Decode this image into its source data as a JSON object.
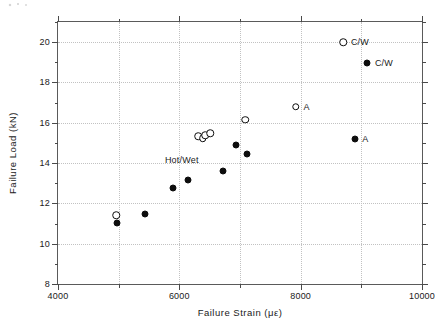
{
  "figure": {
    "background_color": "#ffffff",
    "frame_color": "#5a5a5a",
    "grid_color": "#c2c2c2",
    "marker_color": "#0d0d0d"
  },
  "chart_data": {
    "type": "scatter",
    "title": "",
    "xlabel": "Failure Strain (με)",
    "ylabel": "Failure Load (kN)",
    "xlim": [
      4000,
      10000
    ],
    "ylim": [
      8,
      21
    ],
    "xticks": [
      4000,
      6000,
      8000,
      10000
    ],
    "xtick_labels": [
      "4000",
      "6000",
      "8000",
      "10000"
    ],
    "xticks_minor": [
      5000,
      7000,
      9000
    ],
    "yticks": [
      8,
      10,
      12,
      14,
      16,
      18,
      20
    ],
    "ytick_labels": [
      "8",
      "10",
      "12",
      "14",
      "16",
      "18",
      "20"
    ],
    "yticks_minor": [
      9,
      11,
      13,
      15,
      17,
      19,
      21
    ],
    "grid": true,
    "grid_axis": "both",
    "legend": "none",
    "series": [
      {
        "name": "Open circles",
        "marker": "open-circle",
        "points": [
          {
            "x": 4960,
            "y": 11.42,
            "label": ""
          },
          {
            "x": 6310,
            "y": 15.33,
            "label": ""
          },
          {
            "x": 6390,
            "y": 15.23,
            "label": ""
          },
          {
            "x": 6430,
            "y": 15.37,
            "label": ""
          },
          {
            "x": 6510,
            "y": 15.47,
            "label": ""
          },
          {
            "x": 7090,
            "y": 16.16,
            "label": ""
          },
          {
            "x": 7920,
            "y": 16.8,
            "label": "A"
          },
          {
            "x": 8700,
            "y": 20.0,
            "label": "C/W"
          }
        ]
      },
      {
        "name": "Filled circles",
        "marker": "filled-circle",
        "points": [
          {
            "x": 4970,
            "y": 11.02,
            "label": ""
          },
          {
            "x": 5430,
            "y": 11.46,
            "label": ""
          },
          {
            "x": 5890,
            "y": 12.75,
            "label": ""
          },
          {
            "x": 6140,
            "y": 13.17,
            "label": ""
          },
          {
            "x": 6720,
            "y": 13.63,
            "label": ""
          },
          {
            "x": 6930,
            "y": 14.9,
            "label": ""
          },
          {
            "x": 7110,
            "y": 14.43,
            "label": ""
          },
          {
            "x": 8890,
            "y": 15.2,
            "label": "A"
          },
          {
            "x": 9100,
            "y": 18.95,
            "label": "C/W"
          }
        ]
      }
    ],
    "annotations": [
      {
        "text": "Hot/Wet",
        "x": 6040,
        "y": 14.13
      }
    ]
  }
}
